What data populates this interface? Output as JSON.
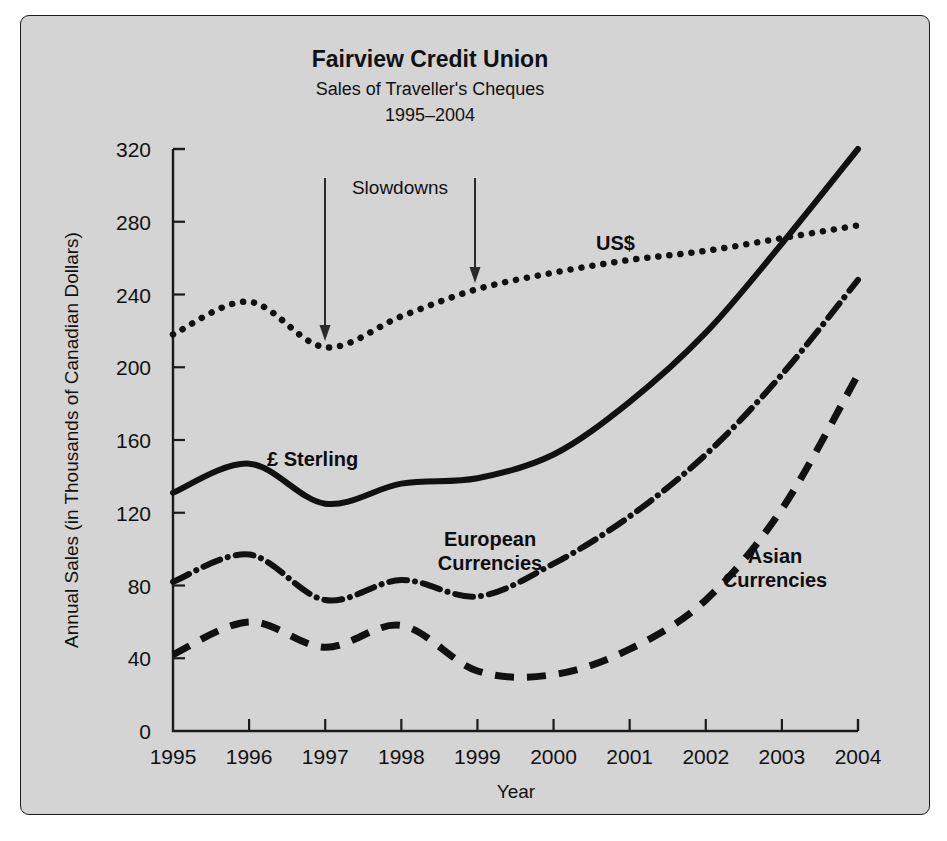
{
  "panel": {
    "bg": "#d4d4d4",
    "border": "#1c1c1c"
  },
  "chart_data": {
    "type": "line",
    "title": "Fairview Credit Union",
    "subtitle": "Sales of Traveller's Cheques",
    "subtitle2": "1995–2004",
    "xlabel": "Year",
    "ylabel": "Annual Sales (in Thousands of Canadian Dollars)",
    "xlim": [
      1995,
      2004
    ],
    "ylim": [
      0,
      320
    ],
    "grid": false,
    "legend_position": "inline-labels",
    "xticks": [
      "1995",
      "1996",
      "1997",
      "1998",
      "1999",
      "2000",
      "2001",
      "2002",
      "2003",
      "2004"
    ],
    "yticks": [
      "0",
      "40",
      "80",
      "120",
      "160",
      "200",
      "240",
      "280",
      "320"
    ],
    "x": [
      1995,
      1996,
      1997,
      1998,
      1999,
      2000,
      2001,
      2002,
      2003,
      2004
    ],
    "series": [
      {
        "name": "US$",
        "label": "US$",
        "style": "dotted",
        "color": "#111111",
        "values": [
          218,
          236,
          211,
          228,
          243,
          252,
          259,
          264,
          271,
          278
        ]
      },
      {
        "name": "£ Sterling",
        "label": "£ Sterling",
        "style": "solid",
        "color": "#111111",
        "values": [
          131,
          147,
          125,
          136,
          139,
          152,
          181,
          219,
          268,
          320
        ]
      },
      {
        "name": "European Currencies",
        "label": "European\nCurrencies",
        "label_line1": "European",
        "label_line2": "Currencies",
        "style": "dash-dot",
        "color": "#111111",
        "values": [
          82,
          97,
          72,
          83,
          74,
          92,
          118,
          152,
          196,
          248
        ]
      },
      {
        "name": "Asian Currencies",
        "label": "Asian\nCurrencies",
        "label_line1": "Asian",
        "label_line2": "Currencies",
        "style": "dashed",
        "color": "#111111",
        "values": [
          42,
          60,
          46,
          58,
          33,
          31,
          45,
          72,
          122,
          196
        ]
      }
    ],
    "annotations": [
      {
        "text": "Slowdowns",
        "arrows_at_years": [
          1997,
          1999
        ],
        "arrow_targets": [
          211,
          243
        ]
      }
    ]
  }
}
